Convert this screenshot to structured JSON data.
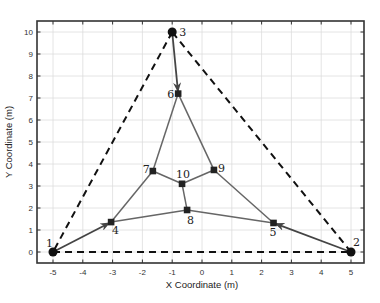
{
  "figure": {
    "xlabel": "X Coordinate (m)",
    "ylabel": "Y Coordinate (m)",
    "xlim": [
      -5.5,
      5.5
    ],
    "ylim": [
      -0.5,
      10.5
    ],
    "xticks": [
      -5,
      -4,
      -3,
      -2,
      -1,
      0,
      1,
      2,
      3,
      4,
      5
    ],
    "yticks": [
      0,
      1,
      2,
      3,
      4,
      5,
      6,
      7,
      8,
      9,
      10
    ],
    "grid": true
  },
  "colors": {
    "axis": "#333333",
    "grid": "#dddddd",
    "boundary": "#111111",
    "edge": "#666666",
    "arrow_edge": "#444444",
    "node": "#111111"
  },
  "nodes": [
    {
      "id": "1",
      "x": -5.0,
      "y": 0.0,
      "type": "terminal",
      "label_dx": -7,
      "label_dy": -5
    },
    {
      "id": "2",
      "x": 5.0,
      "y": 0.0,
      "type": "terminal",
      "label_dx": 2,
      "label_dy": -6
    },
    {
      "id": "3",
      "x": -1.0,
      "y": 10.0,
      "type": "terminal",
      "label_dx": 7,
      "label_dy": 4
    },
    {
      "id": "4",
      "x": -3.05,
      "y": 1.36,
      "type": "steiner",
      "label_dx": 1,
      "label_dy": 12
    },
    {
      "id": "5",
      "x": 2.4,
      "y": 1.32,
      "type": "steiner",
      "label_dx": -4,
      "label_dy": 13
    },
    {
      "id": "6",
      "x": -0.8,
      "y": 7.2,
      "type": "steiner",
      "label_dx": -11,
      "label_dy": 4
    },
    {
      "id": "7",
      "x": -1.65,
      "y": 3.68,
      "type": "steiner",
      "label_dx": -10,
      "label_dy": 2
    },
    {
      "id": "8",
      "x": -0.5,
      "y": 1.91,
      "type": "steiner",
      "label_dx": 0,
      "label_dy": 14
    },
    {
      "id": "9",
      "x": 0.4,
      "y": 3.73,
      "type": "steiner",
      "label_dx": 4,
      "label_dy": 2
    },
    {
      "id": "10",
      "x": -0.67,
      "y": 3.1,
      "type": "steiner",
      "label_dx": -6,
      "label_dy": -6
    }
  ],
  "boundary_edges": [
    [
      "1",
      "2"
    ],
    [
      "2",
      "3"
    ],
    [
      "3",
      "1"
    ]
  ],
  "arrow_edges": [
    [
      "1",
      "4"
    ],
    [
      "2",
      "5"
    ],
    [
      "3",
      "6"
    ]
  ],
  "edges": [
    [
      "4",
      "7"
    ],
    [
      "4",
      "8"
    ],
    [
      "5",
      "9"
    ],
    [
      "5",
      "8"
    ],
    [
      "6",
      "7"
    ],
    [
      "6",
      "9"
    ],
    [
      "7",
      "10"
    ],
    [
      "9",
      "10"
    ],
    [
      "10",
      "8"
    ]
  ]
}
